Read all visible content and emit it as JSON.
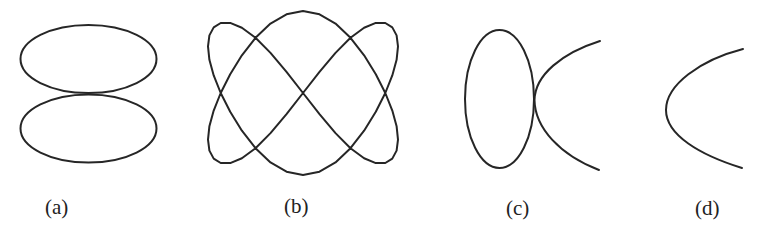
{
  "figure": {
    "panels": [
      {
        "id": "a",
        "label": "(a)",
        "description": "Two identical horizontal ellipses stacked vertically, touching at one point"
      },
      {
        "id": "b",
        "label": "(b)",
        "description": "Lissajous-type closed curve with seven self-intersections"
      },
      {
        "id": "c",
        "label": "(c)",
        "description": "Vertical ellipse touching the vertex of a right-opening curve"
      },
      {
        "id": "d",
        "label": "(d)",
        "description": "Single right-opening curve"
      }
    ],
    "stroke_color": "#262626",
    "background_color": "#ffffff"
  }
}
